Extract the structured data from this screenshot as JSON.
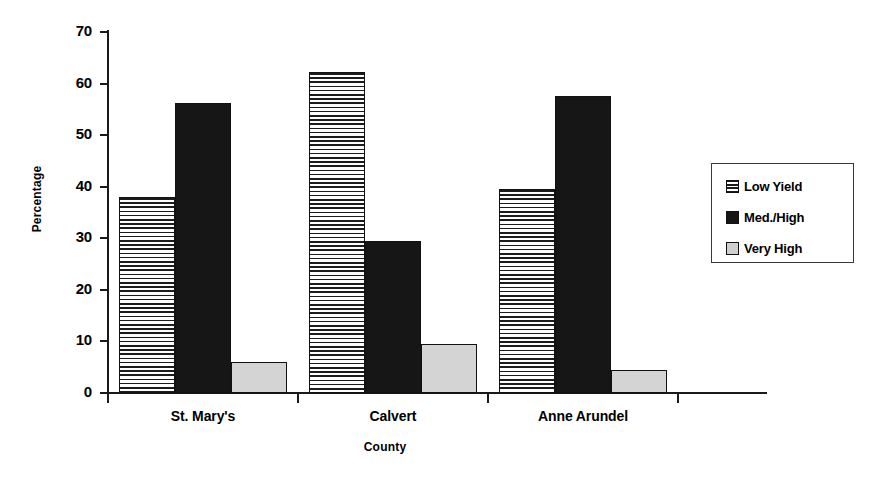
{
  "chart_data": {
    "type": "bar",
    "title": "",
    "subtitle": "",
    "xlabel": "County",
    "ylabel": "Percentage",
    "categories": [
      "St. Mary's",
      "Calvert",
      "Anne Arundel"
    ],
    "series": [
      {
        "name": "Low Yield",
        "values": [
          38.0,
          62.3,
          39.5
        ]
      },
      {
        "name": "Med./High",
        "values": [
          56.2,
          29.5,
          57.5
        ]
      },
      {
        "name": "Very High",
        "values": [
          6.1,
          9.5,
          4.5
        ]
      }
    ],
    "ylim": [
      0,
      70
    ],
    "ytick_step": 10,
    "yticks": [
      0,
      10,
      20,
      30,
      40,
      50,
      60,
      70
    ],
    "ytick_labels": [
      "0",
      "10",
      "20",
      "30",
      "40",
      "50",
      "60",
      "70"
    ],
    "grid": false,
    "legend_position": "right",
    "colors": {
      "low_yield": "#d8d8d8",
      "med_high": "#161616",
      "very_high": "#d4d4d4",
      "axis": "#1a1a1a",
      "background": "#ffffff"
    },
    "patterns": {
      "low_yield": "horizontal-stripes",
      "med_high": "solid-black",
      "very_high": "solid-light-gray"
    }
  },
  "legend": {
    "items": [
      {
        "label": "Low Yield",
        "swatch": "striped-swatch-icon"
      },
      {
        "label": "Med./High",
        "swatch": "black-swatch-icon"
      },
      {
        "label": "Very High",
        "swatch": "gray-swatch-icon"
      }
    ]
  }
}
